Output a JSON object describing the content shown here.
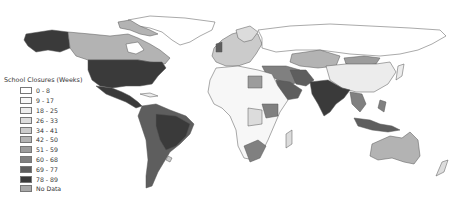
{
  "map": {
    "title": "School Closures (Weeks)",
    "legend": {
      "title": "School Closures (Weeks)",
      "items": [
        {
          "label": "0 - 8",
          "color": "#ffffff"
        },
        {
          "label": "9 - 17",
          "color": "#f7f7f7"
        },
        {
          "label": "18 - 25",
          "color": "#ececec"
        },
        {
          "label": "26 - 33",
          "color": "#dcdcdc"
        },
        {
          "label": "34 - 41",
          "color": "#cbcbcb"
        },
        {
          "label": "42 - 50",
          "color": "#b3b3b3"
        },
        {
          "label": "51 - 59",
          "color": "#9c9c9c"
        },
        {
          "label": "60 - 68",
          "color": "#808080"
        },
        {
          "label": "69 - 77",
          "color": "#5e5e5e"
        },
        {
          "label": "78 - 89",
          "color": "#3a3a3a"
        },
        {
          "label": "No Data",
          "color": "#a8a8a8"
        }
      ]
    },
    "regions": [
      {
        "name": "Alaska",
        "class": "78 - 89"
      },
      {
        "name": "Canada",
        "class": "42 - 50"
      },
      {
        "name": "Greenland",
        "class": "0 - 8"
      },
      {
        "name": "United States",
        "class": "78 - 89"
      },
      {
        "name": "Mexico",
        "class": "78 - 89"
      },
      {
        "name": "South America",
        "class": "69 - 77"
      },
      {
        "name": "Russia",
        "class": "0 - 8"
      },
      {
        "name": "China",
        "class": "18 - 25"
      },
      {
        "name": "Mongolia",
        "class": "51 - 59"
      },
      {
        "name": "Kazakhstan",
        "class": "42 - 50"
      },
      {
        "name": "India",
        "class": "78 - 89"
      },
      {
        "name": "Saudi Arabia",
        "class": "69 - 77"
      },
      {
        "name": "Australia",
        "class": "42 - 50"
      },
      {
        "name": "Africa",
        "class": "9 - 17"
      },
      {
        "name": "Southern Africa",
        "class": "60 - 68"
      },
      {
        "name": "Europe",
        "class": "34 - 41"
      },
      {
        "name": "Indonesia",
        "class": "69 - 77"
      }
    ]
  }
}
